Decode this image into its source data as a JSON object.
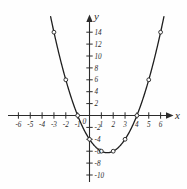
{
  "chart_data": {
    "type": "line",
    "title": "",
    "subtitle": "",
    "xlabel": "x",
    "ylabel": "y",
    "equation": "y = x^2 - 3x - 4",
    "grid": false,
    "legend": null,
    "xlim": [
      -7,
      7
    ],
    "ylim": [
      -11,
      15
    ],
    "x_ticks": [
      -6,
      -5,
      -4,
      -3,
      -2,
      -1,
      1,
      2,
      3,
      4,
      5,
      6
    ],
    "x_tick_labels": [
      "-6",
      "-5",
      "-4",
      "-3",
      "-2",
      "-1",
      "1",
      "2",
      "3",
      "4",
      "5",
      "6"
    ],
    "y_ticks": [
      14,
      12,
      10,
      8,
      6,
      4,
      2,
      -2,
      -4,
      -6,
      -8,
      -10
    ],
    "y_tick_labels": [
      "14",
      "12",
      "10",
      "8",
      "6",
      "4",
      "2",
      "-2",
      "-4",
      "-6",
      "-8",
      "-10"
    ],
    "origin_label": "0",
    "series": [
      {
        "name": "y = x^2 - 3x - 4",
        "marker": "open-circle",
        "x": [
          -3,
          -2,
          -1,
          0,
          1,
          2,
          3,
          4,
          5,
          6
        ],
        "y": [
          14,
          6,
          0,
          -4,
          -6,
          -6,
          -4,
          0,
          6,
          14
        ]
      }
    ],
    "x_intercepts": [
      -1,
      4
    ],
    "y_intercept": -4,
    "vertex": [
      1.5,
      -6.25
    ],
    "colors": {
      "background": "#fefefe",
      "axis": "#2b2b2b",
      "curve": "#1f1f1f",
      "marker_fill": "#fefefe"
    }
  },
  "axis_labels": {
    "x_axis_name": "x",
    "y_axis_name": "y"
  }
}
